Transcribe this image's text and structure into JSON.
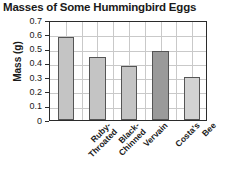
{
  "chart_data": {
    "type": "bar",
    "title": "Masses of Some Hummingbird Eggs",
    "xlabel": "",
    "ylabel": "Mass (g)",
    "ylim": [
      0,
      0.7
    ],
    "ytick_labels": [
      "0.7",
      "0.6",
      "0.5",
      "0.4",
      "0.3",
      "0.2",
      "0.1",
      "0"
    ],
    "ytick_values": [
      0.7,
      0.6,
      0.5,
      0.4,
      0.3,
      0.2,
      0.1,
      0
    ],
    "grid": true,
    "legend": "none",
    "categories": [
      "Ruby-Throated",
      "Black-Chinned",
      "Vervain",
      "Costa's",
      "Bee"
    ],
    "category_lines": [
      [
        "Ruby-",
        "Throated"
      ],
      [
        "Black-",
        "Chinned"
      ],
      [
        "Vervain",
        ""
      ],
      [
        "Costa's",
        ""
      ],
      [
        "Bee",
        ""
      ]
    ],
    "values": [
      0.58,
      0.44,
      0.38,
      0.48,
      0.3
    ],
    "bar_colors": [
      "#c4c4c4",
      "#c4c4c4",
      "#c4c4c4",
      "#9a9a9a",
      "#d2d2d2"
    ],
    "bar_edge_color": "#555555",
    "grid_color": "#c9c9c9",
    "axis_color": "#2b2b2b"
  }
}
